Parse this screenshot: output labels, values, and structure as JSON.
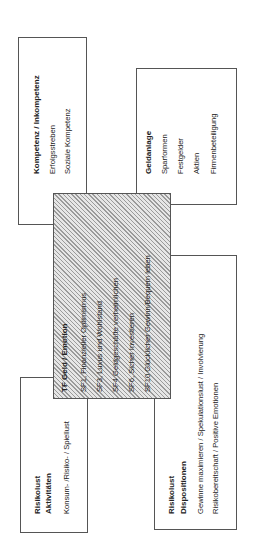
{
  "diagram": {
    "kompetenz": {
      "title": "Kompetenz / Inkompetenz",
      "items": [
        "Erfolgsstreben",
        "Soziale Kompetenz"
      ]
    },
    "geldanlage": {
      "title": "Geldanlage",
      "items": [
        "Sparformen",
        "Festgelder",
        "Aktien",
        "Firmenbeteiligung"
      ]
    },
    "center": {
      "title": "TF   Geld / Emotion",
      "items": [
        "SF1, Finanzieller Optimismus",
        "SF3, Luxus und Wohlstand",
        "SF4  Geldgeschäfte verheimlichen",
        "SF6, Sicher Investieren",
        "SF10  Glücklicher Gewinn/Bequem leben"
      ],
      "fill_pattern": "diagonal-hatch"
    },
    "aktivitaeten": {
      "title_line1": "Risikolust",
      "title_line2": "Aktivitäten",
      "items": [
        "Konsum- /Risiko- / Spiellust"
      ]
    },
    "dispositionen": {
      "title_line1": "Risikolust",
      "title_line2": "Dispositionen",
      "items": [
        "Gewinne maximieren / Spekulationslust  /  Involvierung",
        "Risikobereitschaft / Positive Emotionen"
      ]
    }
  }
}
